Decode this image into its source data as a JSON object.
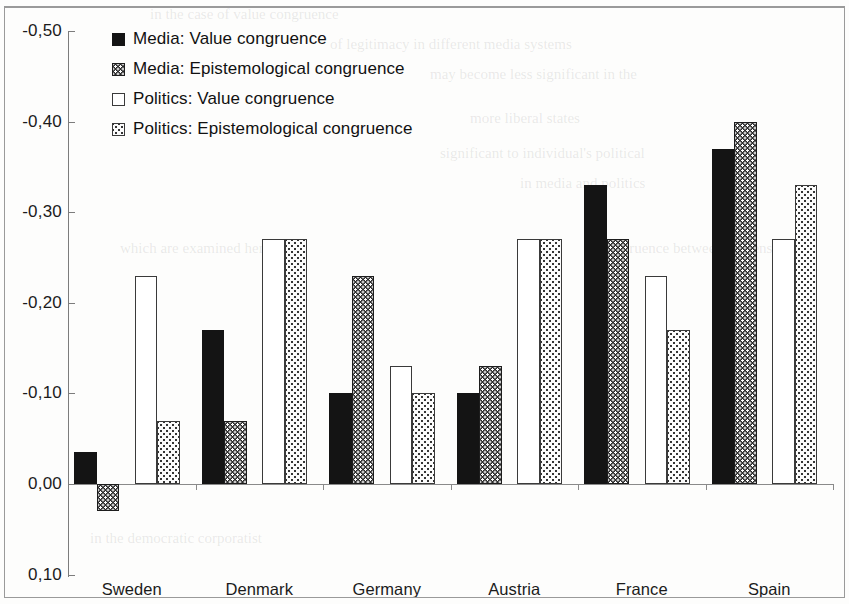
{
  "chart_data": {
    "type": "bar",
    "title": "",
    "subtitle": "",
    "xlabel": "",
    "ylabel": "",
    "categories": [
      "Sweden",
      "Denmark",
      "Germany",
      "Austria",
      "France",
      "Spain"
    ],
    "y_axis": {
      "inverted": true,
      "ticks": [
        "-0,50",
        "-0,40",
        "-0,30",
        "-0,20",
        "-0,10",
        "0,00",
        "0,10"
      ],
      "tick_values": [
        -0.5,
        -0.4,
        -0.3,
        -0.2,
        -0.1,
        0.0,
        0.1
      ],
      "ylim": [
        -0.5,
        0.1
      ],
      "grid": false
    },
    "legend": {
      "position": "upper-left-inside",
      "entries": [
        {
          "label": "Media: Value congruence",
          "swatch": "solid-black"
        },
        {
          "label": "Media: Epistemological congruence",
          "swatch": "dark-dotted"
        },
        {
          "label": "Politics: Value congruence",
          "swatch": "white-outline"
        },
        {
          "label": "Politics: Epistemological congruence",
          "swatch": "light-dotted"
        }
      ]
    },
    "series": [
      {
        "name": "Media: Value congruence",
        "style": "solid-black",
        "values": [
          -0.035,
          -0.17,
          -0.1,
          -0.1,
          -0.33,
          -0.37
        ]
      },
      {
        "name": "Media: Epistemological congruence",
        "style": "dark-dotted",
        "values": [
          0.03,
          -0.07,
          -0.23,
          -0.13,
          -0.27,
          -0.4
        ]
      },
      {
        "name": "Politics: Value congruence",
        "style": "white-outline",
        "values": [
          -0.23,
          -0.27,
          -0.13,
          -0.27,
          -0.23,
          -0.27
        ]
      },
      {
        "name": "Politics: Epistemological congruence",
        "style": "light-dotted",
        "values": [
          -0.07,
          -0.27,
          -0.1,
          -0.27,
          -0.17,
          -0.33
        ]
      }
    ]
  },
  "bleed_text": {
    "lines": [
      "in the case of value congruence",
      "of legitimacy in different media systems",
      "may become less significant in the",
      "more liberal states",
      "significant to individual's political",
      "in media and politics",
      "which are examined here",
      "congruence between citizens",
      "in the democratic corporatist"
    ]
  }
}
